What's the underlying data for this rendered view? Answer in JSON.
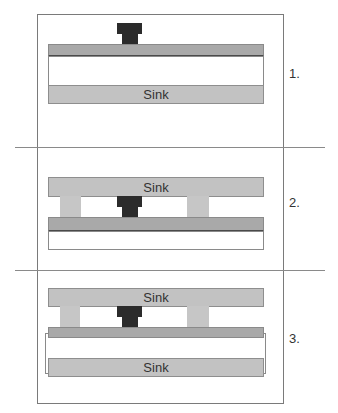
{
  "diagram": {
    "colors": {
      "sink": "#c2c2c2",
      "pillar": "#c6c6c6",
      "layer": "#a9a9a9",
      "layer_bottom_line": "#4a4a4a",
      "chip": "#2b2b2b",
      "substrate": "#ffffff",
      "frame": "#7a7a7a"
    },
    "steps": [
      {
        "label": "1.",
        "sinks": [
          "Sink"
        ]
      },
      {
        "label": "2.",
        "sinks": [
          "Sink"
        ]
      },
      {
        "label": "3.",
        "sinks": [
          "Sink",
          "Sink"
        ]
      }
    ]
  }
}
